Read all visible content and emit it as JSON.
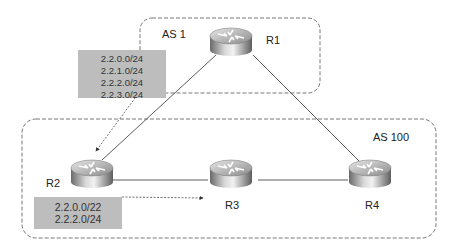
{
  "diagram": {
    "autonomous_systems": [
      {
        "id": "as1",
        "label": "AS 1"
      },
      {
        "id": "as100",
        "label": "AS 100"
      }
    ],
    "routers": [
      {
        "id": "r1",
        "label": "R1",
        "as": "AS 1"
      },
      {
        "id": "r2",
        "label": "R2",
        "as": "AS 100"
      },
      {
        "id": "r3",
        "label": "R3",
        "as": "AS 100"
      },
      {
        "id": "r4",
        "label": "R4",
        "as": "AS 100"
      }
    ],
    "links": [
      {
        "from": "R1",
        "to": "R2"
      },
      {
        "from": "R1",
        "to": "R4"
      },
      {
        "from": "R2",
        "to": "R3"
      },
      {
        "from": "R3",
        "to": "R4"
      }
    ],
    "advertisements": [
      {
        "from": "R1",
        "to": "R2",
        "prefixes": [
          "2.2.0.0/24",
          "2.2.1.0/24",
          "2.2.2.0/24",
          "2.2.3.0/24"
        ]
      },
      {
        "from": "R2",
        "to": "R3",
        "prefixes": [
          "2.2.0.0/22",
          "2.2.2.0/24"
        ]
      }
    ],
    "colors": {
      "box_fill": "#bdbdbd",
      "line": "#333333",
      "boundary": "#555555"
    }
  }
}
